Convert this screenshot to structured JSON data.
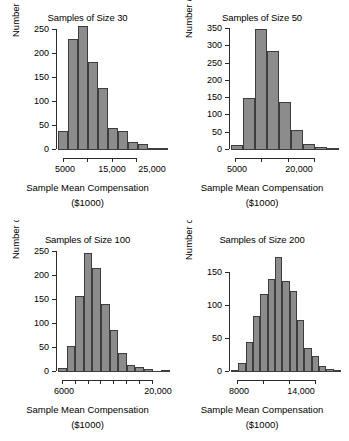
{
  "figure": {
    "panel_count": 4,
    "bar_fill": "#8c8c8c",
    "bar_stroke": "#3d3d3d",
    "axis_color": "#2b2b2b"
  },
  "chart_data": [
    {
      "type": "bar",
      "id": "samples-of-size-30",
      "title": "Samples of Size 30",
      "xlabel_line1": "Sample Mean Compensation",
      "xlabel_line2": "($1000)",
      "ylabel": "Number of Samples",
      "ylim": [
        0,
        270
      ],
      "yticks": [
        0,
        50,
        100,
        150,
        200,
        250
      ],
      "ytick_labels": [
        "0",
        "50",
        "100",
        "150",
        "200",
        "250"
      ],
      "xticks": [
        5000,
        15000,
        25000
      ],
      "xtick_labels": [
        "5000",
        "",
        "15,000",
        "25,000"
      ],
      "xtick_count": 4,
      "grid": false,
      "values": [
        40,
        240,
        268,
        190,
        135,
        48,
        40,
        17,
        12,
        3,
        2
      ],
      "categories": [
        "b1",
        "b2",
        "b3",
        "b4",
        "b5",
        "b6",
        "b7",
        "b8",
        "b9",
        "b10",
        "b11"
      ]
    },
    {
      "type": "bar",
      "id": "samples-of-size-50",
      "title": "Samples of Size 50",
      "xlabel_line1": "Sample Mean Compensation",
      "xlabel_line2": "($1000)",
      "ylabel": "Number of Samples",
      "ylim": [
        0,
        355
      ],
      "yticks": [
        0,
        50,
        100,
        150,
        200,
        250,
        300,
        350
      ],
      "ytick_labels": [
        "0",
        "50",
        "100",
        "150",
        "200",
        "250",
        "300",
        "350"
      ],
      "xticks": [
        5000,
        20000
      ],
      "xtick_labels": [
        "5000",
        "",
        "20,000",
        ""
      ],
      "xtick_count": 4,
      "grid": false,
      "values": [
        13,
        146,
        340,
        279,
        136,
        57,
        18,
        9,
        2
      ],
      "categories": [
        "b1",
        "b2",
        "b3",
        "b4",
        "b5",
        "b6",
        "b7",
        "b8",
        "b9"
      ]
    },
    {
      "type": "bar",
      "id": "samples-of-size-100",
      "title": "Samples of Size 100",
      "xlabel_line1": "Sample Mean Compensation",
      "xlabel_line2": "($1000)",
      "ylabel": "Number of Samples",
      "ylim": [
        0,
        262
      ],
      "yticks": [
        0,
        50,
        100,
        150,
        200,
        250
      ],
      "ytick_labels": [
        "0",
        "50",
        "100",
        "150",
        "200",
        "250"
      ],
      "xticks": [
        6000,
        20000
      ],
      "xtick_labels": [
        "6000",
        "",
        "",
        "",
        "",
        "",
        "",
        "20,000"
      ],
      "xtick_count": 8,
      "grid": false,
      "values": [
        8,
        55,
        159,
        250,
        217,
        143,
        89,
        40,
        14,
        11,
        6,
        0,
        2
      ],
      "categories": [
        "b1",
        "b2",
        "b3",
        "b4",
        "b5",
        "b6",
        "b7",
        "b8",
        "b9",
        "b10",
        "b11",
        "b12",
        "b13"
      ]
    },
    {
      "type": "bar",
      "id": "samples-of-size-200",
      "title": "Samples of Size 200",
      "xlabel_line1": "Sample Mean Compensation",
      "xlabel_line2": "($1000)",
      "ylabel": "Number of Samples",
      "ylim": [
        0,
        178
      ],
      "yticks": [
        0,
        50,
        100,
        150
      ],
      "ytick_labels": [
        "0",
        "50",
        "100",
        "150"
      ],
      "xticks": [
        8000,
        14000
      ],
      "xtick_labels": [
        "8000",
        "",
        "14,000",
        ""
      ],
      "xtick_count": 4,
      "grid": false,
      "values": [
        2,
        14,
        45,
        84,
        117,
        140,
        173,
        138,
        122,
        78,
        36,
        24,
        9,
        4,
        2
      ],
      "categories": [
        "b1",
        "b2",
        "b3",
        "b4",
        "b5",
        "b6",
        "b7",
        "b8",
        "b9",
        "b10",
        "b11",
        "b12",
        "b13",
        "b14",
        "b15"
      ]
    }
  ]
}
